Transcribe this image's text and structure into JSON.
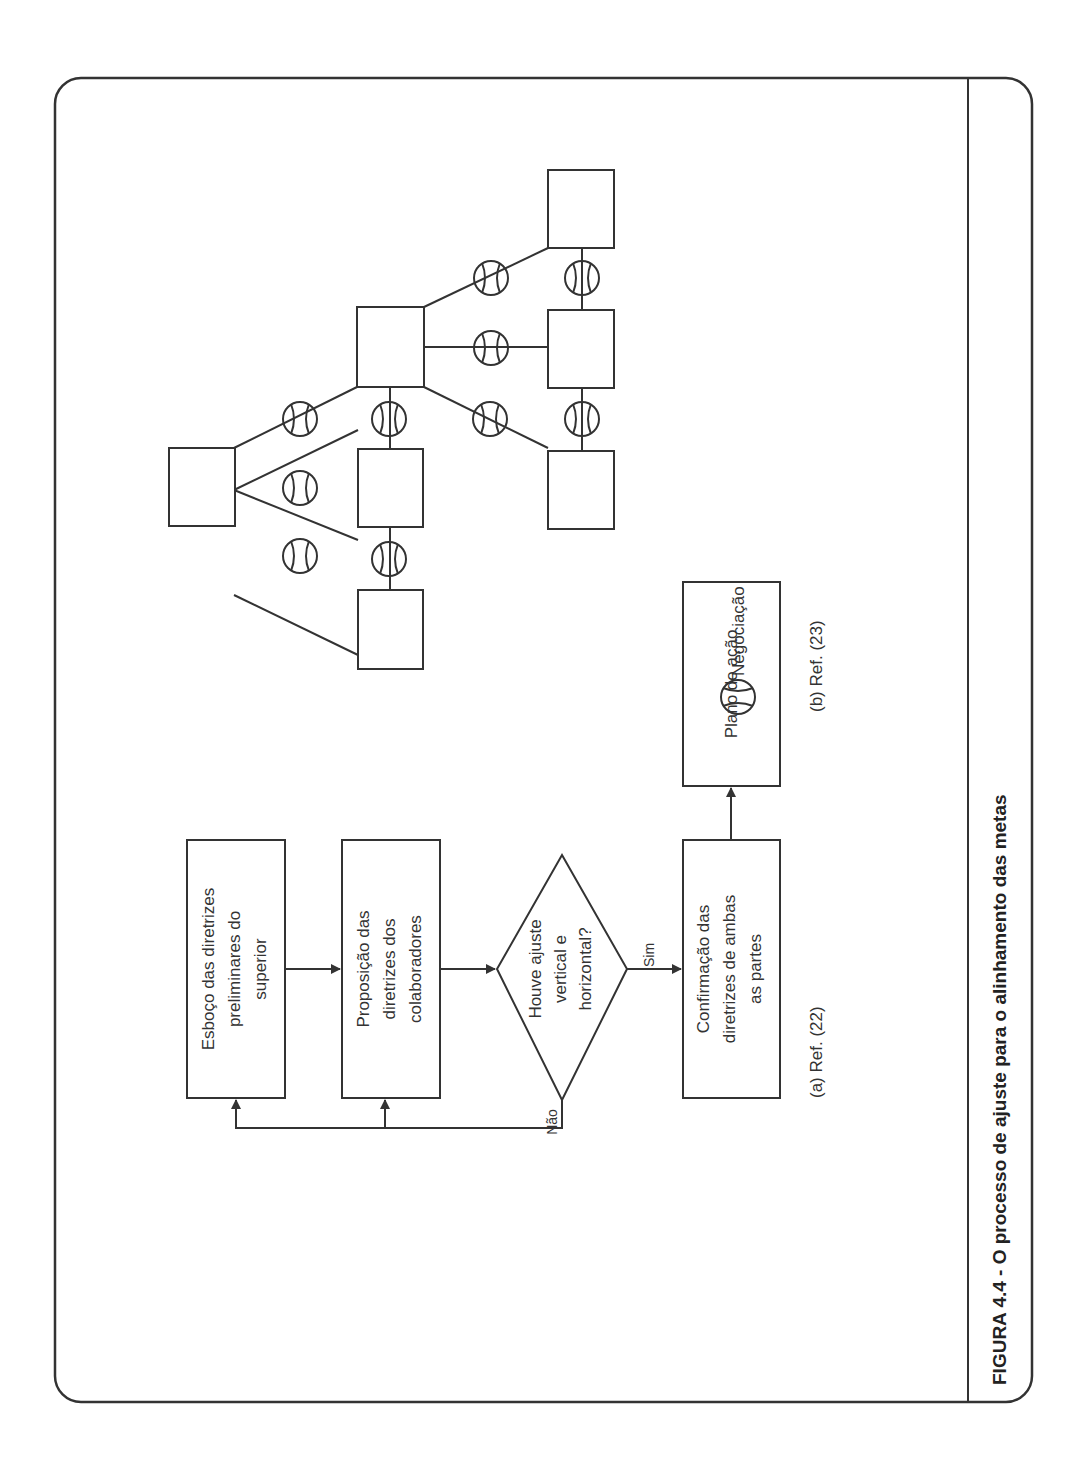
{
  "figure": {
    "caption": "FIGURA 4.4 - O processo de ajuste para o alinhamento das metas",
    "orientation": "rotated 90° counter-clockwise"
  },
  "panel_a": {
    "reference": "(a) Ref. (22)",
    "boxes": [
      {
        "id": "esboco",
        "lines": [
          "Esboço das diretrizes",
          "preliminares do",
          "superior"
        ]
      },
      {
        "id": "proposicao",
        "lines": [
          "Proposição das",
          "diretrizes dos",
          "colaboradores"
        ]
      },
      {
        "id": "decisao",
        "lines": [
          "Houve ajuste",
          "vertical e",
          "horizontal?"
        ]
      },
      {
        "id": "confirmacao",
        "lines": [
          "Confirmação das",
          "diretrizes de ambas",
          "as partes"
        ]
      },
      {
        "id": "plano",
        "lines": [
          "Plano de ação"
        ]
      }
    ],
    "edge_labels": {
      "yes": "Sim",
      "no": "Não"
    }
  },
  "panel_b": {
    "reference": "(b) Ref. (23)",
    "legend": {
      "symbol": "negotiation-circle",
      "label": "Negociação"
    }
  },
  "colors": {
    "line": "#333333",
    "background": "#ffffff"
  }
}
